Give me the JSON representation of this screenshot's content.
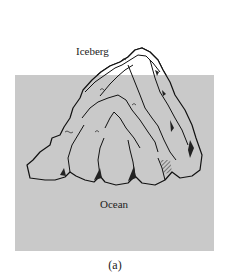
{
  "figure": {
    "caption": "(a)",
    "labels": {
      "iceberg": "Iceberg",
      "ocean": "Ocean"
    },
    "colors": {
      "ocean_fill": "#c9c9c9",
      "iceberg_fill": "#c9c9c9",
      "iceberg_above_water_fill": "#ffffff",
      "outline": "#111111",
      "background": "#ffffff"
    }
  }
}
